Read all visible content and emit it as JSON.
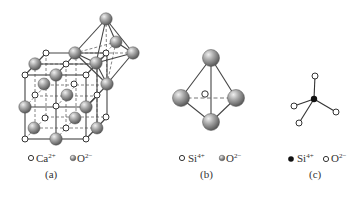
{
  "figure": {
    "panels": [
      {
        "id": "a",
        "caption": "(a)",
        "structure": "rock-salt cubic lattice with octahedral coordination",
        "legend": [
          {
            "symbol": "small-open-circle",
            "label": "Ca",
            "charge": "2+"
          },
          {
            "symbol": "gray-sphere",
            "label": "O",
            "charge": "2−"
          }
        ]
      },
      {
        "id": "b",
        "caption": "(b)",
        "structure": "tetrahedron",
        "legend": [
          {
            "symbol": "small-open-circle",
            "label": "Si",
            "charge": "4+"
          },
          {
            "symbol": "gray-sphere",
            "label": "O",
            "charge": "2−"
          }
        ]
      },
      {
        "id": "c",
        "caption": "(c)",
        "structure": "ball-and-stick tetrahedron",
        "legend": [
          {
            "symbol": "filled-black-dot",
            "label": "Si",
            "charge": "4+"
          },
          {
            "symbol": "small-open-circle",
            "label": "O",
            "charge": "2−"
          }
        ]
      }
    ],
    "colors": {
      "line": "#444444",
      "sphere_light": "#d8d8d8",
      "sphere_dark": "#707070",
      "open_circle_stroke": "#333333",
      "dot": "#111111"
    }
  }
}
